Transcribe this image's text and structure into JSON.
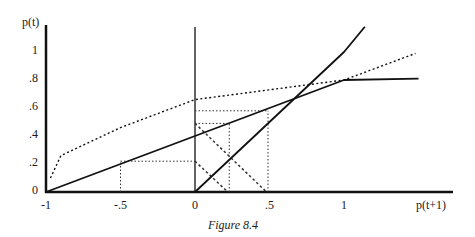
{
  "chart_data": {
    "type": "line",
    "title": "",
    "caption": "Figure 8.4",
    "xlabel": "p(t+1)",
    "ylabel": "p(t)",
    "xlim": [
      -1,
      1.75
    ],
    "ylim": [
      0,
      1.2
    ],
    "grid": false,
    "x_ticks": [
      {
        "value": -1,
        "label": "-1"
      },
      {
        "value": -0.5,
        "label": "-.5"
      },
      {
        "value": 0,
        "label": "0"
      },
      {
        "value": 0.5,
        "label": ".5"
      },
      {
        "value": 1,
        "label": "1"
      }
    ],
    "y_ticks": [
      {
        "value": 0,
        "label": "0"
      },
      {
        "value": 0.2,
        "label": ".2"
      },
      {
        "value": 0.4,
        "label": ".4"
      },
      {
        "value": 0.6,
        "label": ".6"
      },
      {
        "value": 0.8,
        "label": ".8"
      },
      {
        "value": 1,
        "label": "1"
      }
    ],
    "series": [
      {
        "name": "kinked solid line",
        "style": "solid",
        "points": [
          [
            -1,
            0
          ],
          [
            -0.5,
            0.2
          ],
          [
            0,
            0.4
          ],
          [
            0.5,
            0.6
          ],
          [
            1,
            0.8
          ],
          [
            1.5,
            0.81
          ]
        ]
      },
      {
        "name": "45-degree line",
        "style": "solid",
        "points": [
          [
            0,
            0
          ],
          [
            0.5,
            0.5
          ],
          [
            1,
            1
          ],
          [
            1.14,
            1.18
          ]
        ]
      },
      {
        "name": "concave dotted curve",
        "style": "dotted",
        "points": [
          [
            -0.97,
            0.1
          ],
          [
            -0.9,
            0.26
          ],
          [
            -0.5,
            0.46
          ],
          [
            0,
            0.66
          ],
          [
            0.5,
            0.73
          ],
          [
            1,
            0.8
          ],
          [
            1.48,
            0.99
          ]
        ]
      }
    ],
    "reference_lines": [
      {
        "type": "hline",
        "y": 0.22,
        "x_from": -0.5,
        "x_to": 0
      },
      {
        "type": "vline",
        "x": -0.5,
        "y_from": 0,
        "y_to": 0.22
      },
      {
        "type": "hline",
        "y": 0.49,
        "x_from": 0,
        "x_to": 0.23
      },
      {
        "type": "vline",
        "x": 0.23,
        "y_from": 0,
        "y_to": 0.49
      },
      {
        "type": "hline",
        "y": 0.58,
        "x_from": 0,
        "x_to": 0.49
      },
      {
        "type": "vline",
        "x": 0.49,
        "y_from": 0,
        "y_to": 0.58
      },
      {
        "type": "diagonal",
        "from": [
          0,
          0.22
        ],
        "to": [
          0.22,
          0
        ]
      },
      {
        "type": "diagonal",
        "from": [
          0,
          0.49
        ],
        "to": [
          0.48,
          0
        ]
      }
    ]
  }
}
